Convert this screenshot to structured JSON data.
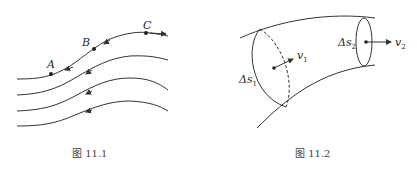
{
  "figures": [
    {
      "id": "fig-11-1",
      "caption": "图 11.1",
      "points": [
        {
          "label": "A"
        },
        {
          "label": "B"
        },
        {
          "label": "C"
        }
      ],
      "streamline_count": 4
    },
    {
      "id": "fig-11-2",
      "caption": "图 11.2",
      "labels": {
        "ds1": "Δs",
        "ds1_sub": "1",
        "ds2": "Δs",
        "ds2_sub": "2",
        "v1": "v",
        "v1_sub": "1",
        "v2": "v",
        "v2_sub": "2"
      }
    }
  ],
  "colors": {
    "line": "#333333",
    "caption": "#444444"
  }
}
